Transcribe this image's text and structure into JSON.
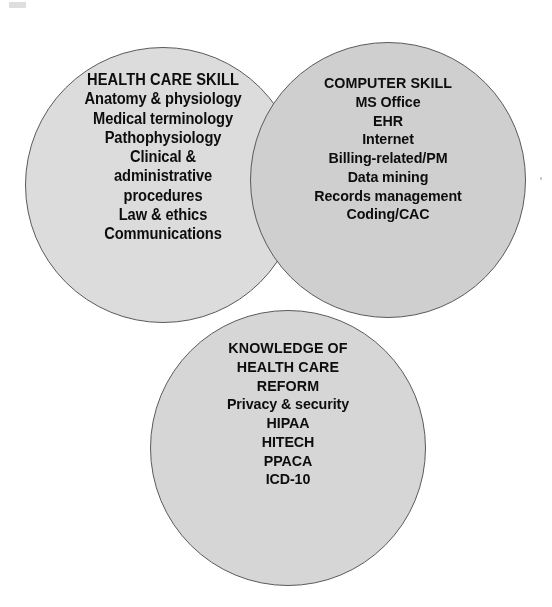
{
  "diagram": {
    "type": "venn-three-circle",
    "background_color": "#ffffff",
    "text_color": "#0d0d0d",
    "outline_color": "#5a5a5a",
    "circles": [
      {
        "id": "health-care-skill",
        "heading": "HEALTH CARE SKILL",
        "fill_color": "#dcdcdc",
        "items": [
          "Anatomy & physiology",
          "Medical terminology",
          "Pathophysiology",
          "Clinical &",
          "administrative",
          "procedures",
          "Law & ethics",
          "Communications"
        ]
      },
      {
        "id": "computer-skill",
        "heading": "COMPUTER SKILL",
        "fill_color": "#cfcfcf",
        "items": [
          "MS Office",
          "EHR",
          "Internet",
          "Billing-related/PM",
          "Data mining",
          "Records management",
          "Coding/CAC"
        ]
      },
      {
        "id": "knowledge-health-care-reform",
        "heading": "KNOWLEDGE OF",
        "heading_line_2": "HEALTH CARE",
        "heading_line_3": "REFORM",
        "fill_color": "#d6d6d6",
        "items": [
          "Privacy & security",
          "HIPAA",
          "HITECH",
          "PPACA",
          "ICD-10"
        ]
      }
    ]
  }
}
